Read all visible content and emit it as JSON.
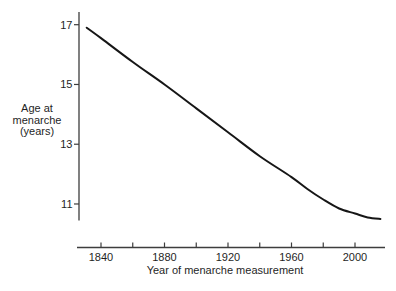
{
  "figure": {
    "y_axis_title_lines": [
      "Age at",
      "menarche",
      "(years)"
    ],
    "x_axis_title": "Year of menarche measurement"
  },
  "chart_data": {
    "type": "line",
    "title": "",
    "xlabel": "Year of menarche measurement",
    "ylabel": "Age at menarche (years)",
    "x_major_ticks": [
      1840,
      1880,
      1920,
      1960,
      2000
    ],
    "x_minor_ticks": [
      1860,
      1900,
      1940,
      1980
    ],
    "y_ticks": [
      17,
      15,
      13,
      11
    ],
    "xlim": [
      1827,
      2019
    ],
    "ylim": [
      10.1,
      17.4
    ],
    "grid": false,
    "legend": null,
    "series": [
      {
        "name": "age-at-menarche-trend",
        "points": [
          [
            1831,
            16.9
          ],
          [
            1840,
            16.55
          ],
          [
            1860,
            15.75
          ],
          [
            1880,
            15.0
          ],
          [
            1900,
            14.2
          ],
          [
            1920,
            13.4
          ],
          [
            1940,
            12.6
          ],
          [
            1960,
            11.9
          ],
          [
            1970,
            11.5
          ],
          [
            1980,
            11.15
          ],
          [
            1990,
            10.85
          ],
          [
            2000,
            10.68
          ],
          [
            2008,
            10.55
          ],
          [
            2016,
            10.5
          ]
        ]
      }
    ],
    "line_color": "#161616",
    "axis_color": "#3d3d3d",
    "text_color": "#1f1f1f",
    "background": "#ffffff"
  }
}
